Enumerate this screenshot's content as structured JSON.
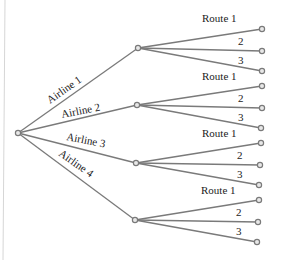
{
  "diagram": {
    "type": "tree",
    "root": {
      "x": 18,
      "y": 133
    },
    "airlines": [
      {
        "label": "Airline 1",
        "node": {
          "x": 138,
          "y": 48
        },
        "label_pos": {
          "x": 50,
          "y": 104,
          "angle": -35
        },
        "routes": [
          {
            "label": "Route 1",
            "x": 262,
            "y": 29,
            "label_pos": {
              "x": 202,
              "y": 22
            }
          },
          {
            "label": "2",
            "x": 262,
            "y": 51,
            "label_pos": {
              "x": 238,
              "y": 45
            }
          },
          {
            "label": "3",
            "x": 262,
            "y": 71,
            "label_pos": {
              "x": 238,
              "y": 64
            }
          }
        ]
      },
      {
        "label": "Airline 2",
        "node": {
          "x": 137,
          "y": 105
        },
        "label_pos": {
          "x": 62,
          "y": 118,
          "angle": -11
        },
        "routes": [
          {
            "label": "Route 1",
            "x": 262,
            "y": 86,
            "label_pos": {
              "x": 202,
              "y": 80
            }
          },
          {
            "label": "2",
            "x": 262,
            "y": 108,
            "label_pos": {
              "x": 238,
              "y": 102
            }
          },
          {
            "label": "3",
            "x": 261,
            "y": 128,
            "label_pos": {
              "x": 238,
              "y": 121
            }
          }
        ]
      },
      {
        "label": "Airline 3",
        "node": {
          "x": 136,
          "y": 163
        },
        "label_pos": {
          "x": 66,
          "y": 140,
          "angle": 11
        },
        "routes": [
          {
            "label": "Route 1",
            "x": 261,
            "y": 143,
            "label_pos": {
              "x": 202,
              "y": 137
            }
          },
          {
            "label": "2",
            "x": 260,
            "y": 165,
            "label_pos": {
              "x": 237,
              "y": 159
            }
          },
          {
            "label": "3",
            "x": 259,
            "y": 185,
            "label_pos": {
              "x": 237,
              "y": 178
            }
          }
        ]
      },
      {
        "label": "Airline 4",
        "node": {
          "x": 135,
          "y": 220
        },
        "label_pos": {
          "x": 58,
          "y": 155,
          "angle": 35
        },
        "routes": [
          {
            "label": "Route 1",
            "x": 259,
            "y": 200,
            "label_pos": {
              "x": 201,
              "y": 194
            }
          },
          {
            "label": "2",
            "x": 258,
            "y": 222,
            "label_pos": {
              "x": 236,
              "y": 216
            }
          },
          {
            "label": "3",
            "x": 257,
            "y": 242,
            "label_pos": {
              "x": 236,
              "y": 235
            }
          }
        ]
      }
    ],
    "colors": {
      "edge": "#7a7a7a",
      "node_fill": "#e8e8e8",
      "text": "#222222"
    }
  }
}
